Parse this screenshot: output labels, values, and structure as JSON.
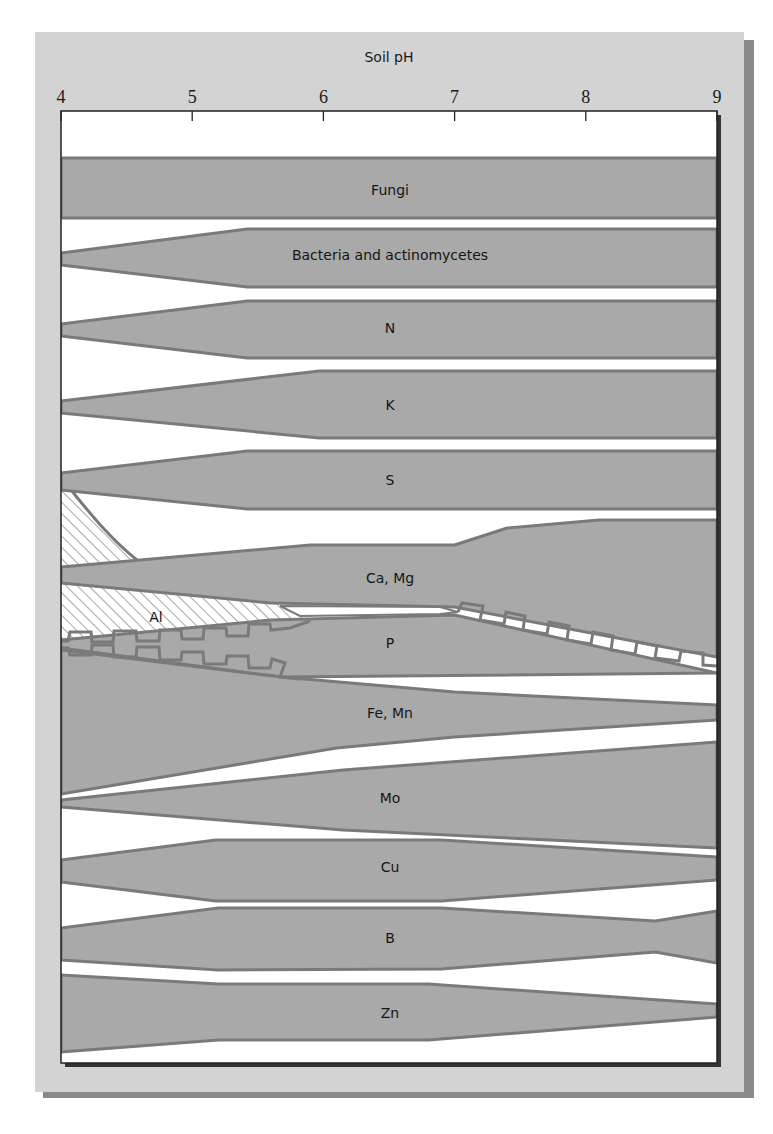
{
  "colors": {
    "page_bg": "#ffffff",
    "card_bg": "#d3d3d3",
    "card_shadow": "#8a8a8a",
    "plot_bg": "#ffffff",
    "plot_border": "#222222",
    "plot_shadow": "#333333",
    "band_fill": "#a9a9a9",
    "band_stroke": "#7a7a7a",
    "hatch": "#777777",
    "text": "#1a1a1a"
  },
  "frame": {
    "card": {
      "x": 35,
      "y": 32,
      "w": 709,
      "h": 1060,
      "shadow_offset": 8
    },
    "plot": {
      "x": 61,
      "y": 111,
      "w": 656,
      "h": 952
    }
  },
  "chart_data": {
    "type": "area",
    "title": "Soil pH",
    "xlabel": "Soil pH",
    "ylabel": "",
    "xlim": [
      4,
      9
    ],
    "x_ticks": [
      4,
      5,
      6,
      7,
      8,
      9
    ],
    "x_tick_labels": [
      "4",
      "5",
      "6",
      "7",
      "8",
      "9"
    ],
    "grid": false,
    "legend": "none",
    "series": [
      {
        "name": "Fungi",
        "label_pos": [
          390,
          195
        ],
        "top": [
          [
            4.0,
            158
          ],
          [
            9.0,
            158
          ]
        ],
        "bottom": [
          [
            4.0,
            218
          ],
          [
            9.0,
            218
          ]
        ]
      },
      {
        "name": "Bacteria and actinomycetes",
        "label_pos": [
          390,
          260
        ],
        "top": [
          [
            4.0,
            253
          ],
          [
            5.42,
            229
          ],
          [
            9.0,
            229
          ]
        ],
        "bottom": [
          [
            4.0,
            265
          ],
          [
            5.42,
            287
          ],
          [
            9.0,
            287
          ]
        ]
      },
      {
        "name": "N",
        "label_pos": [
          390,
          333
        ],
        "top": [
          [
            4.0,
            324
          ],
          [
            5.42,
            301
          ],
          [
            9.0,
            301
          ]
        ],
        "bottom": [
          [
            4.0,
            336
          ],
          [
            5.42,
            358
          ],
          [
            9.0,
            358
          ]
        ]
      },
      {
        "name": "K",
        "label_pos": [
          390,
          410
        ],
        "top": [
          [
            4.0,
            401
          ],
          [
            5.97,
            371
          ],
          [
            9.0,
            371
          ]
        ],
        "bottom": [
          [
            4.0,
            413
          ],
          [
            5.97,
            438
          ],
          [
            9.0,
            438
          ]
        ]
      },
      {
        "name": "S",
        "label_pos": [
          390,
          485
        ],
        "top": [
          [
            4.0,
            473
          ],
          [
            5.42,
            451
          ],
          [
            9.0,
            451
          ]
        ],
        "bottom": [
          [
            4.0,
            490
          ],
          [
            5.42,
            509
          ],
          [
            9.0,
            509
          ]
        ]
      },
      {
        "name": "Ca, Mg",
        "label_pos": [
          390,
          583
        ],
        "top": [
          [
            4.0,
            567
          ],
          [
            5.9,
            545
          ],
          [
            7.0,
            545
          ],
          [
            7.4,
            528
          ],
          [
            8.1,
            520
          ],
          [
            9.0,
            520
          ]
        ],
        "bottom": [
          [
            4.0,
            583
          ],
          [
            5.6,
            603
          ],
          [
            7.0,
            607
          ],
          [
            9.0,
            657
          ]
        ]
      },
      {
        "name": "P",
        "label_pos": [
          390,
          648
        ],
        "top": [
          [
            4.0,
            640
          ],
          [
            5.6,
            620
          ],
          [
            7.0,
            615
          ]
        ],
        "bottom": [
          [
            4.0,
            648
          ],
          [
            5.68,
            677
          ],
          [
            9.0,
            673
          ]
        ]
      },
      {
        "name": "Fe, Mn",
        "label_pos": [
          390,
          718
        ],
        "top": [
          [
            4.0,
            650
          ],
          [
            5.68,
            677
          ],
          [
            7.0,
            692
          ],
          [
            9.0,
            705
          ]
        ],
        "bottom": [
          [
            4.0,
            794
          ],
          [
            6.1,
            748
          ],
          [
            7.0,
            737
          ],
          [
            9.0,
            720
          ]
        ]
      },
      {
        "name": "Mo",
        "label_pos": [
          390,
          803
        ],
        "top": [
          [
            4.0,
            800
          ],
          [
            6.15,
            770
          ],
          [
            9.0,
            742
          ]
        ],
        "bottom": [
          [
            4.0,
            807
          ],
          [
            6.15,
            830
          ],
          [
            9.0,
            848
          ]
        ]
      },
      {
        "name": "Cu",
        "label_pos": [
          390,
          872
        ],
        "top": [
          [
            4.0,
            860
          ],
          [
            5.18,
            840
          ],
          [
            6.9,
            840
          ],
          [
            9.0,
            857
          ]
        ],
        "bottom": [
          [
            4.0,
            882
          ],
          [
            5.18,
            901
          ],
          [
            6.9,
            901
          ],
          [
            9.0,
            880
          ]
        ]
      },
      {
        "name": "B",
        "label_pos": [
          390,
          943
        ],
        "top": [
          [
            4.0,
            928
          ],
          [
            5.2,
            908
          ],
          [
            6.9,
            908
          ],
          [
            8.53,
            921
          ],
          [
            9.0,
            911
          ]
        ],
        "bottom": [
          [
            4.0,
            960
          ],
          [
            5.2,
            970
          ],
          [
            6.9,
            969
          ],
          [
            8.53,
            952
          ],
          [
            9.0,
            963
          ]
        ]
      },
      {
        "name": "Zn",
        "label_pos": [
          390,
          1018
        ],
        "top": [
          [
            4.0,
            975
          ],
          [
            5.2,
            984
          ],
          [
            6.8,
            984
          ],
          [
            9.0,
            1004
          ]
        ],
        "bottom": [
          [
            4.0,
            1052
          ],
          [
            5.2,
            1040
          ],
          [
            6.8,
            1040
          ],
          [
            9.0,
            1017
          ]
        ]
      }
    ],
    "hatched_regions": [
      {
        "name": "Al (toxicity, upper)",
        "label": ""
      },
      {
        "name": "Al",
        "label": "Al",
        "label_pos": [
          156,
          620
        ]
      }
    ],
    "annotations": [
      "Al"
    ]
  },
  "labels": {
    "axis_title": "Soil pH",
    "ticks": [
      "4",
      "5",
      "6",
      "7",
      "8",
      "9"
    ],
    "bands": [
      "Fungi",
      "Bacteria and actinomycetes",
      "N",
      "K",
      "S",
      "Ca, Mg",
      "P",
      "Fe, Mn",
      "Mo",
      "Cu",
      "B",
      "Zn"
    ],
    "al_label": "Al"
  }
}
